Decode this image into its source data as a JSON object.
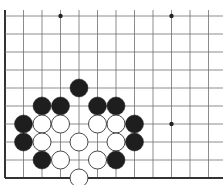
{
  "board": {
    "grid": {
      "x_lines": [
        5,
        23.5,
        42,
        60.5,
        79,
        97.5,
        116,
        134.5,
        153,
        171.5,
        190,
        208.5
      ],
      "y_lines": [
        16,
        34,
        52,
        70,
        88,
        106,
        124,
        142,
        160,
        178
      ],
      "x_extent": [
        5,
        223
      ],
      "y_extent": [
        10,
        178
      ],
      "line_color": "#6e6e6e",
      "edge_color": "#333333"
    },
    "edges": [
      "left",
      "bottom"
    ],
    "star_points": [
      {
        "x": 60.5,
        "y": 16
      },
      {
        "x": 171.5,
        "y": 16
      },
      {
        "x": 171.5,
        "y": 124
      }
    ],
    "stone_radius": 9,
    "colors": {
      "black": "#1e1e1e",
      "white": "#ffffff",
      "white_stroke": "#333333"
    },
    "stones": [
      {
        "color": "black",
        "x": 79,
        "y": 88
      },
      {
        "color": "black",
        "x": 42,
        "y": 106
      },
      {
        "color": "black",
        "x": 60.5,
        "y": 106
      },
      {
        "color": "black",
        "x": 97.5,
        "y": 106
      },
      {
        "color": "black",
        "x": 116,
        "y": 106
      },
      {
        "color": "black",
        "x": 23.5,
        "y": 124
      },
      {
        "color": "white",
        "x": 42,
        "y": 124
      },
      {
        "color": "white",
        "x": 60.5,
        "y": 124
      },
      {
        "color": "white",
        "x": 97.5,
        "y": 124
      },
      {
        "color": "white",
        "x": 116,
        "y": 124
      },
      {
        "color": "black",
        "x": 134.5,
        "y": 124
      },
      {
        "color": "black",
        "x": 23.5,
        "y": 142
      },
      {
        "color": "white",
        "x": 42,
        "y": 142
      },
      {
        "color": "white",
        "x": 79,
        "y": 142
      },
      {
        "color": "white",
        "x": 116,
        "y": 142
      },
      {
        "color": "black",
        "x": 134.5,
        "y": 142
      },
      {
        "color": "black",
        "x": 42,
        "y": 160
      },
      {
        "color": "white",
        "x": 60.5,
        "y": 160
      },
      {
        "color": "white",
        "x": 97.5,
        "y": 160
      },
      {
        "color": "black",
        "x": 116,
        "y": 160
      },
      {
        "color": "white",
        "x": 79,
        "y": 178
      }
    ]
  }
}
